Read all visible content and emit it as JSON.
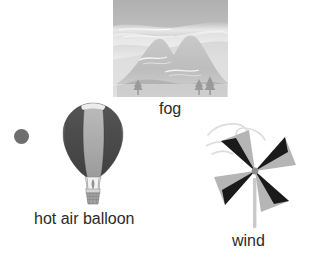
{
  "canvas": {
    "width": 317,
    "height": 259,
    "background": "#ffffff"
  },
  "items": [
    {
      "id": "fog",
      "label": "fog",
      "icon_name": "foggy-mountain-scene-image",
      "description": "Grayscale photo-style illustration of two misty mountain peaks with fog bands in the sky and small pine trees at the base"
    },
    {
      "id": "hot-air-balloon",
      "label": "hot air balloon",
      "icon_name": "hot-air-balloon-illustration",
      "description": "Hot air balloon with alternating dark gray and light gray gores, burner and woven basket below"
    },
    {
      "id": "wind",
      "label": "wind",
      "icon_name": "pinwheel-illustration",
      "description": "Four-blade paper pinwheel on a stick, each blade split into a black half and a light gray half, with a faint wind swirl to the upper left"
    }
  ],
  "decorations": [
    {
      "id": "gray-dot",
      "icon_name": "filled-circle-marker",
      "color": "#6e6e6e",
      "size_px": 15
    }
  ],
  "colors": {
    "background": "#ffffff",
    "text": "#2b2b2b",
    "dot": "#6e6e6e",
    "balloon_dark": "#4a4a4a",
    "balloon_light": "#a8a8a8",
    "balloon_top": "#e8e8e8",
    "pinwheel_dark": "#1a1a1a",
    "pinwheel_light": "#b5b5b5",
    "pinwheel_stick": "#c9c9c9",
    "fog_sky_top": "#b4b4b4",
    "fog_sky_bottom": "#f2f2f2",
    "fog_mountain": "#c2c2c2",
    "fog_mountain_shadow": "#ababab"
  }
}
